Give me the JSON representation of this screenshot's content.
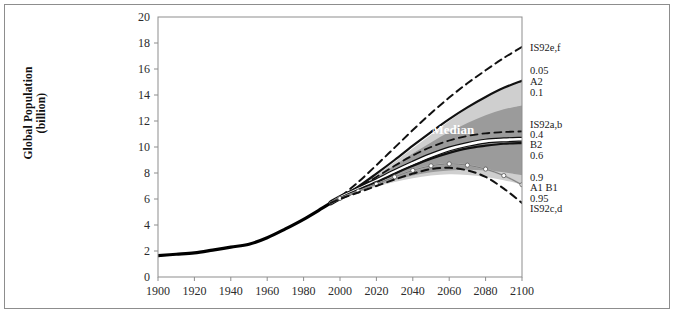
{
  "figure": {
    "name": "global-population-projections"
  },
  "chart_data": {
    "type": "line",
    "title": "",
    "xlabel": "",
    "ylabel": "Global Population (billion)",
    "ylabel_line1": "Global Population",
    "ylabel_line2": "(billion)",
    "xlim": [
      1900,
      2100
    ],
    "ylim": [
      0,
      20
    ],
    "xticks": [
      1900,
      1920,
      1940,
      1960,
      1980,
      2000,
      2020,
      2040,
      2060,
      2080,
      2100
    ],
    "yticks": [
      0,
      2,
      4,
      6,
      8,
      10,
      12,
      14,
      16,
      18,
      20
    ],
    "grid": false,
    "legend_position": "right-outside",
    "annotations": [
      {
        "text": "Median",
        "x": 2062,
        "y": 11.0,
        "color": "#ffffff",
        "bold": true
      }
    ],
    "bands": [
      {
        "name": "0.05-0.95 probabilistic interval",
        "fill": "#cfcfcf",
        "x": [
          1995,
          2000,
          2010,
          2020,
          2030,
          2040,
          2050,
          2060,
          2070,
          2080,
          2090,
          2100
        ],
        "upper": [
          5.9,
          6.15,
          6.95,
          7.85,
          8.85,
          9.9,
          10.95,
          12.0,
          13.0,
          13.9,
          14.6,
          15.1
        ],
        "lower": [
          5.9,
          6.05,
          6.55,
          6.95,
          7.3,
          7.6,
          7.8,
          7.9,
          7.85,
          7.7,
          7.45,
          7.1
        ]
      },
      {
        "name": "0.1-0.9 probabilistic interval",
        "fill": "#9b9b9b",
        "x": [
          1995,
          2000,
          2010,
          2020,
          2030,
          2040,
          2050,
          2060,
          2070,
          2080,
          2090,
          2100
        ],
        "upper": [
          5.9,
          6.14,
          6.88,
          7.7,
          8.6,
          9.5,
          10.35,
          11.15,
          11.85,
          12.45,
          12.9,
          13.2
        ],
        "lower": [
          5.9,
          6.06,
          6.6,
          7.05,
          7.45,
          7.8,
          8.05,
          8.2,
          8.25,
          8.2,
          8.05,
          7.85
        ]
      }
    ],
    "series": [
      {
        "name": "Historical population",
        "style": "solid",
        "color": "#000000",
        "width": 3.2,
        "x": [
          1900,
          1910,
          1920,
          1930,
          1940,
          1950,
          1960,
          1970,
          1980,
          1990,
          1995
        ],
        "y": [
          1.65,
          1.75,
          1.86,
          2.07,
          2.3,
          2.52,
          3.02,
          3.7,
          4.44,
          5.27,
          5.7
        ]
      },
      {
        "name": "IS92e,f",
        "label": "IS92e,f",
        "style": "dashed",
        "color": "#111111",
        "width": 2.0,
        "x": [
          1995,
          2000,
          2010,
          2020,
          2030,
          2040,
          2050,
          2060,
          2070,
          2080,
          2090,
          2100
        ],
        "y": [
          5.7,
          6.15,
          7.3,
          8.6,
          9.95,
          11.3,
          12.6,
          13.8,
          14.9,
          15.9,
          16.85,
          17.7
        ],
        "end_value": 17.7
      },
      {
        "name": "A2",
        "label": "A2",
        "style": "solid",
        "color": "#111111",
        "width": 2.2,
        "x": [
          1995,
          2000,
          2010,
          2020,
          2030,
          2040,
          2050,
          2060,
          2070,
          2080,
          2090,
          2100
        ],
        "y": [
          5.7,
          6.1,
          6.95,
          7.95,
          9.0,
          10.1,
          11.15,
          12.15,
          13.05,
          13.85,
          14.55,
          15.1
        ],
        "end_value": 15.1
      },
      {
        "name": "IS92a,b",
        "label": "IS92a,b",
        "style": "dashed",
        "color": "#111111",
        "width": 1.8,
        "x": [
          1995,
          2000,
          2010,
          2020,
          2030,
          2040,
          2050,
          2060,
          2070,
          2080,
          2090,
          2100
        ],
        "y": [
          5.7,
          6.1,
          6.85,
          7.7,
          8.55,
          9.35,
          10.0,
          10.5,
          10.85,
          11.05,
          11.15,
          11.2
        ],
        "end_value": 11.2
      },
      {
        "name": "Median",
        "label": "Median",
        "style": "solid",
        "color": "#ffffff",
        "outline": "#111111",
        "width": 2.6,
        "x": [
          1995,
          2000,
          2010,
          2020,
          2030,
          2040,
          2050,
          2060,
          2070,
          2080,
          2090,
          2100
        ],
        "y": [
          5.7,
          6.1,
          6.75,
          7.4,
          8.1,
          8.75,
          9.35,
          9.85,
          10.2,
          10.45,
          10.55,
          10.6
        ],
        "end_value": 10.6
      },
      {
        "name": "B2",
        "label": "B2",
        "style": "solid",
        "color": "#111111",
        "width": 2.2,
        "x": [
          1995,
          2000,
          2010,
          2020,
          2030,
          2040,
          2050,
          2060,
          2070,
          2080,
          2090,
          2100
        ],
        "y": [
          5.7,
          6.08,
          6.7,
          7.3,
          7.95,
          8.55,
          9.1,
          9.55,
          9.9,
          10.1,
          10.25,
          10.3
        ],
        "end_value": 10.3
      },
      {
        "name": "A1 B1",
        "label": "A1 B1",
        "style": "solid-markers",
        "color": "#b4b4b4",
        "marker": "circle-open",
        "width": 1.8,
        "x": [
          1995,
          2000,
          2010,
          2020,
          2030,
          2040,
          2050,
          2060,
          2070,
          2080,
          2090,
          2100
        ],
        "y": [
          5.7,
          6.05,
          6.6,
          7.15,
          7.7,
          8.2,
          8.55,
          8.7,
          8.6,
          8.3,
          7.8,
          7.1
        ],
        "end_value": 7.1
      },
      {
        "name": "IS92c,d",
        "label": "IS92c,d",
        "style": "dashed",
        "color": "#111111",
        "width": 2.0,
        "x": [
          1995,
          2000,
          2010,
          2020,
          2030,
          2040,
          2050,
          2060,
          2070,
          2080,
          2090,
          2100
        ],
        "y": [
          5.7,
          6.0,
          6.5,
          7.0,
          7.5,
          7.95,
          8.3,
          8.4,
          8.2,
          7.7,
          6.8,
          5.7
        ],
        "end_value": 5.7
      }
    ],
    "right_labels": [
      {
        "text": "IS92e,f",
        "y_value": 17.7,
        "group": "scenario"
      },
      {
        "text": "0.05",
        "y_value": 15.9,
        "group": "percentile"
      },
      {
        "text": "A2",
        "y_value": 15.1,
        "group": "scenario"
      },
      {
        "text": "0.1",
        "y_value": 14.2,
        "group": "percentile"
      },
      {
        "text": "IS92a,b",
        "y_value": 11.8,
        "group": "scenario"
      },
      {
        "text": "0.4",
        "y_value": 11.0,
        "group": "percentile"
      },
      {
        "text": "B2",
        "y_value": 10.2,
        "group": "scenario"
      },
      {
        "text": "0.6",
        "y_value": 9.4,
        "group": "percentile"
      },
      {
        "text": "0.9",
        "y_value": 7.7,
        "group": "percentile"
      },
      {
        "text": "A1 B1",
        "y_value": 6.9,
        "group": "scenario"
      },
      {
        "text": "0.95",
        "y_value": 6.1,
        "group": "percentile"
      },
      {
        "text": "IS92c,d",
        "y_value": 5.3,
        "group": "scenario"
      }
    ],
    "colors": {
      "band_outer": "#cfcfcf",
      "band_inner": "#9b9b9b",
      "line": "#111111",
      "median": "#ffffff",
      "axis": "#8d8d8d",
      "text": "#2b2b2b"
    }
  }
}
